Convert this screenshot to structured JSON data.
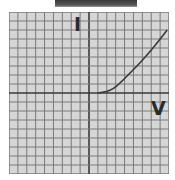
{
  "diagram": {
    "title": "",
    "axis_labels": {
      "y": "I",
      "x": "V"
    },
    "grid": {
      "columns": 18,
      "rows": 18,
      "background": "#d6d6d6",
      "line_color": "#7a7a7a",
      "axis_color": "#3a3a3a"
    },
    "curve": {
      "description": "Diode-like I-V characteristic: zero current until ~1 unit, then rising exponentially",
      "color": "#3a3a3a",
      "points": [
        [
          1,
          0
        ],
        [
          2,
          0.15
        ],
        [
          2.7,
          0.45
        ],
        [
          3.5,
          1.1
        ],
        [
          4.4,
          2.0
        ],
        [
          5.5,
          3.1
        ],
        [
          6.6,
          4.3
        ],
        [
          7.7,
          5.6
        ],
        [
          8.8,
          7.0
        ]
      ]
    }
  }
}
